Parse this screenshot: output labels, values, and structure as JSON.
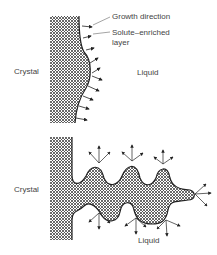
{
  "top_panel": {
    "crystal_label": "Crystal",
    "liquid_label": "Liquid",
    "growth_direction_label": "Growth direction",
    "solute_layer_label_line1": "Solute–enriched",
    "solute_layer_label_line2": "layer"
  },
  "bottom_panel": {
    "crystal_label": "Crystal",
    "liquid_label": "Liquid"
  },
  "colors": {
    "ink": "#222222",
    "hatch": "#555555",
    "background": "#ffffff"
  }
}
